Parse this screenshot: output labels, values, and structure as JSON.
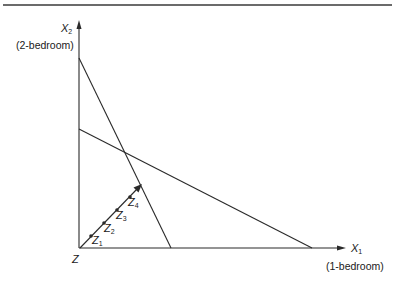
{
  "diagram": {
    "type": "linear-programming-graph",
    "colors": {
      "ink": "#2a2a2a",
      "background": "#ffffff"
    },
    "y_axis": {
      "symbol": "X",
      "subscript": "2",
      "description": "(2-bedroom)"
    },
    "x_axis": {
      "symbol": "X",
      "subscript": "1",
      "description": "(1-bedroom)"
    },
    "origin_label": "Z",
    "constraint_lines": [
      {
        "name": "steep-constraint",
        "from": [
          79,
          58
        ],
        "to": [
          171,
          248
        ]
      },
      {
        "name": "shallow-constraint",
        "from": [
          79,
          129
        ],
        "to": [
          312,
          248
        ]
      }
    ],
    "intersection": [
      125,
      151
    ],
    "ray": {
      "from": [
        80,
        248
      ],
      "to": [
        141,
        185
      ],
      "points": [
        {
          "label": "Z",
          "sub": "1",
          "dot": [
            91,
            236
          ],
          "text_pos": [
            92,
            244
          ]
        },
        {
          "label": "Z",
          "sub": "2",
          "dot": [
            104,
            223
          ],
          "text_pos": [
            104,
            232
          ]
        },
        {
          "label": "Z",
          "sub": "3",
          "dot": [
            117,
            210
          ],
          "text_pos": [
            116,
            219
          ]
        },
        {
          "label": "Z",
          "sub": "4",
          "dot": [
            130,
            197
          ],
          "text_pos": [
            128,
            206
          ]
        }
      ]
    }
  }
}
